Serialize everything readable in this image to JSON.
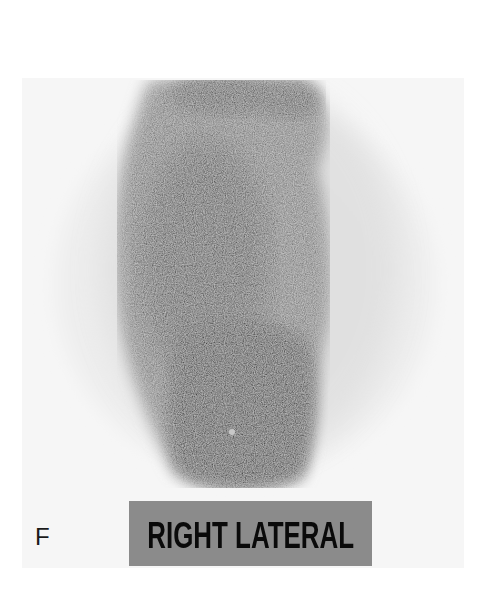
{
  "figure": {
    "panel_letter": "F",
    "view_label": "RIGHT LATERAL",
    "image_type": "gamma camera scintigraphy scan (grayscale)",
    "colors": {
      "background": "#ffffff",
      "field_of_view": "#f3f3f3",
      "label_box": "#8b8b8b",
      "label_text": "#0a0a0a",
      "uptake_dark": "#050505"
    }
  }
}
